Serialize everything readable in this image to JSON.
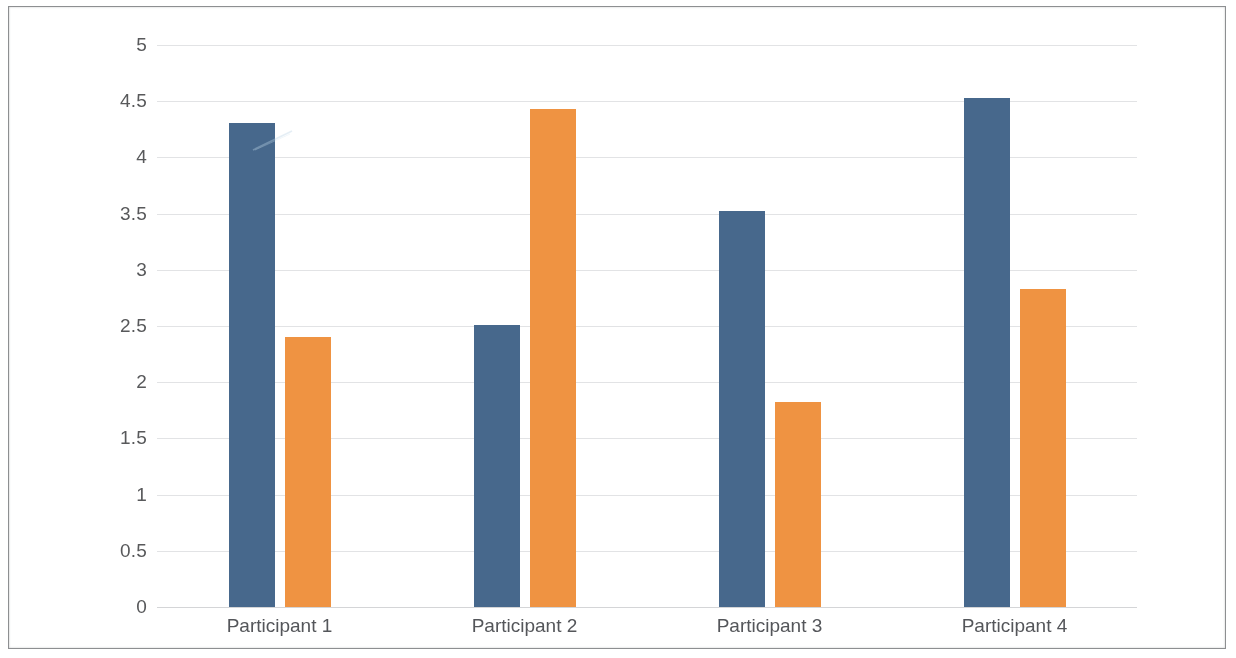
{
  "chart_data": {
    "type": "bar",
    "title": "",
    "subtitle": "",
    "xlabel": "",
    "ylabel": "",
    "categories": [
      "Participant 1",
      "Participant 2",
      "Participant 3",
      "Participant 4"
    ],
    "series": [
      {
        "name": "Series 1",
        "color": "#47688c",
        "values": [
          4.31,
          2.51,
          3.52,
          4.53
        ]
      },
      {
        "name": "Series 2",
        "color": "#ef9342",
        "values": [
          2.4,
          4.43,
          1.82,
          2.83
        ]
      }
    ],
    "ylim": [
      0,
      5
    ],
    "ytick_labels": [
      "5",
      "4.5",
      "4",
      "3.5",
      "3",
      "2.5",
      "2",
      "1.5",
      "1",
      "0.5",
      "0"
    ],
    "ytick_values": [
      5,
      4.5,
      4,
      3.5,
      3,
      2.5,
      2,
      1.5,
      1,
      0.5,
      0
    ],
    "grid": true,
    "grid_axis": "y",
    "legend": false,
    "legend_position": "none",
    "background": "#ffffff",
    "grid_color": "#e2e3e5",
    "axis_text_color": "#58595b",
    "bar_width_px": 46,
    "annotations": []
  },
  "figure": {
    "border_color": "#8d8f91",
    "artifact_name": "scan-streak"
  }
}
